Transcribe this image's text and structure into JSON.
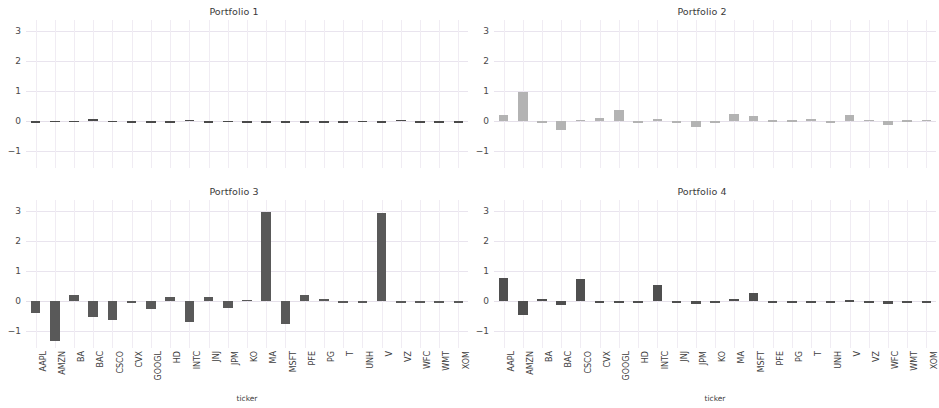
{
  "figure": {
    "width": 936,
    "height": 408,
    "background": "#ffffff",
    "grid_color": "#e9e4ee",
    "xlabel": "ticker"
  },
  "chart_data": {
    "type": "bar",
    "title": "",
    "xlabel": "ticker",
    "ylabel": "",
    "ylim": [
      -1.55,
      3.35
    ],
    "yticks": [
      3,
      2,
      1,
      0,
      -1
    ],
    "grid": true,
    "legend": "none",
    "categories": [
      "AAPL",
      "AMZN",
      "BA",
      "BAC",
      "CSCO",
      "CVX",
      "GOOGL",
      "HD",
      "INTC",
      "JNJ",
      "JPM",
      "KO",
      "MA",
      "MSFT",
      "PFE",
      "PG",
      "T",
      "UNH",
      "V",
      "VZ",
      "WFC",
      "WMT",
      "XOM"
    ],
    "panels": [
      {
        "title": "Portfolio 1",
        "color": "#4a4a4a",
        "values": [
          0.0,
          0.02,
          0.01,
          0.06,
          0.02,
          0.0,
          0.0,
          0.0,
          0.05,
          0.0,
          0.02,
          0.0,
          0.0,
          0.0,
          0.0,
          0.0,
          0.0,
          0.02,
          0.0,
          0.05,
          0.0,
          0.0,
          0.0
        ]
      },
      {
        "title": "Portfolio 2",
        "color": "#b3b3b3",
        "values": [
          0.22,
          0.95,
          0.0,
          -0.28,
          0.05,
          0.1,
          0.38,
          0.0,
          0.07,
          0.0,
          -0.2,
          0.0,
          0.25,
          0.16,
          0.04,
          0.03,
          0.06,
          0.0,
          0.22,
          0.05,
          -0.12,
          0.03,
          0.05
        ]
      },
      {
        "title": "Portfolio 3",
        "color": "#595959",
        "values": [
          -0.38,
          -1.32,
          0.2,
          -0.52,
          -0.62,
          -0.05,
          -0.25,
          0.13,
          -0.7,
          0.14,
          -0.23,
          0.05,
          2.95,
          -0.75,
          0.2,
          0.07,
          -0.02,
          0.0,
          2.93,
          0.0,
          -0.05,
          0.0,
          -0.03
        ]
      },
      {
        "title": "Portfolio 4",
        "color": "#4f4f4f",
        "values": [
          0.78,
          -0.45,
          0.07,
          -0.12,
          0.72,
          0.0,
          0.0,
          0.0,
          0.55,
          0.0,
          -0.08,
          0.0,
          0.07,
          0.27,
          -0.04,
          0.0,
          -0.03,
          -0.05,
          0.03,
          -0.03,
          -0.08,
          0.0,
          -0.01
        ]
      }
    ]
  }
}
